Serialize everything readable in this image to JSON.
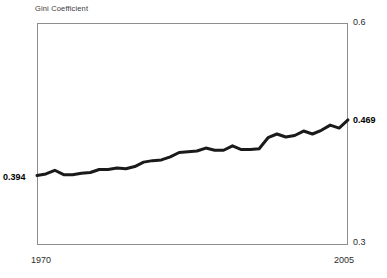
{
  "chart_data": {
    "type": "line",
    "title": "",
    "ylabel": "Gini Coefficient",
    "xlabel": "",
    "ylim": [
      0.3,
      0.6
    ],
    "xlim": [
      1970,
      2005
    ],
    "grid": false,
    "legend": false,
    "y_ticks": [
      "0.3",
      "0.6"
    ],
    "x_ticks": [
      "1970",
      "2005"
    ],
    "series": [
      {
        "name": "Gini Coefficient",
        "color": "#1a1a1a",
        "x": [
          1970,
          1971,
          1972,
          1973,
          1974,
          1975,
          1976,
          1977,
          1978,
          1979,
          1980,
          1981,
          1982,
          1983,
          1984,
          1985,
          1986,
          1987,
          1988,
          1989,
          1990,
          1991,
          1992,
          1993,
          1994,
          1995,
          1996,
          1997,
          1998,
          1999,
          2000,
          2001,
          2002,
          2003,
          2004,
          2005
        ],
        "values": [
          0.394,
          0.396,
          0.401,
          0.395,
          0.395,
          0.397,
          0.398,
          0.402,
          0.402,
          0.404,
          0.403,
          0.406,
          0.412,
          0.414,
          0.415,
          0.419,
          0.425,
          0.426,
          0.427,
          0.431,
          0.428,
          0.428,
          0.434,
          0.429,
          0.429,
          0.43,
          0.445,
          0.45,
          0.446,
          0.448,
          0.454,
          0.45,
          0.455,
          0.462,
          0.458,
          0.469
        ]
      }
    ],
    "annotations": [
      {
        "label": "0.394",
        "x": 1970,
        "y": 0.394,
        "position": "left",
        "bold": true
      },
      {
        "label": "0.469",
        "x": 2005,
        "y": 0.469,
        "position": "right",
        "bold": true
      }
    ]
  },
  "labels": {
    "axis_title": "Gini Coefficient",
    "y_max": "0.6",
    "y_min": "0.3",
    "x_start": "1970",
    "x_end": "2005",
    "value_start": "0.394",
    "value_end": "0.469"
  },
  "colors": {
    "line": "#1a1a1a",
    "frame": "#8e8e8e",
    "text": "#2b2b2b",
    "background": "#ffffff"
  }
}
